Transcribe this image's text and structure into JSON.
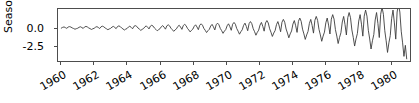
{
  "chart_data": {
    "type": "line",
    "title": "",
    "xlabel": "",
    "ylabel": "Seasonal",
    "xtick_labels": [
      "1960",
      "1962",
      "1964",
      "1966",
      "1968",
      "1970",
      "1972",
      "1974",
      "1976",
      "1978",
      "1980"
    ],
    "ytick_labels": [
      "0.0",
      "-2.5"
    ],
    "ytick_values": [
      0.0,
      -2.5
    ],
    "xlim": [
      1959.8,
      1981.2
    ],
    "ylim": [
      -4.6,
      2.6
    ],
    "grid": false,
    "legend": null,
    "line_color": "#3c3c3c",
    "series": [
      {
        "name": "Seasonal",
        "x": [
          1960.0,
          1960.083,
          1960.167,
          1960.25,
          1960.333,
          1960.417,
          1960.5,
          1960.583,
          1960.667,
          1960.75,
          1960.833,
          1960.917,
          1961.0,
          1961.083,
          1961.167,
          1961.25,
          1961.333,
          1961.417,
          1961.5,
          1961.583,
          1961.667,
          1961.75,
          1961.833,
          1961.917,
          1962.0,
          1962.083,
          1962.167,
          1962.25,
          1962.333,
          1962.417,
          1962.5,
          1962.583,
          1962.667,
          1962.75,
          1962.833,
          1962.917,
          1963.0,
          1963.083,
          1963.167,
          1963.25,
          1963.333,
          1963.417,
          1963.5,
          1963.583,
          1963.667,
          1963.75,
          1963.833,
          1963.917,
          1964.0,
          1964.083,
          1964.167,
          1964.25,
          1964.333,
          1964.417,
          1964.5,
          1964.583,
          1964.667,
          1964.75,
          1964.833,
          1964.917,
          1965.0,
          1965.083,
          1965.167,
          1965.25,
          1965.333,
          1965.417,
          1965.5,
          1965.583,
          1965.667,
          1965.75,
          1965.833,
          1965.917,
          1966.0,
          1966.083,
          1966.167,
          1966.25,
          1966.333,
          1966.417,
          1966.5,
          1966.583,
          1966.667,
          1966.75,
          1966.833,
          1966.917,
          1967.0,
          1967.083,
          1967.167,
          1967.25,
          1967.333,
          1967.417,
          1967.5,
          1967.583,
          1967.667,
          1967.75,
          1967.833,
          1967.917,
          1968.0,
          1968.083,
          1968.167,
          1968.25,
          1968.333,
          1968.417,
          1968.5,
          1968.583,
          1968.667,
          1968.75,
          1968.833,
          1968.917,
          1969.0,
          1969.083,
          1969.167,
          1969.25,
          1969.333,
          1969.417,
          1969.5,
          1969.583,
          1969.667,
          1969.75,
          1969.833,
          1969.917,
          1970.0,
          1970.083,
          1970.167,
          1970.25,
          1970.333,
          1970.417,
          1970.5,
          1970.583,
          1970.667,
          1970.75,
          1970.833,
          1970.917,
          1971.0,
          1971.083,
          1971.167,
          1971.25,
          1971.333,
          1971.417,
          1971.5,
          1971.583,
          1971.667,
          1971.75,
          1971.833,
          1971.917,
          1972.0,
          1972.083,
          1972.167,
          1972.25,
          1972.333,
          1972.417,
          1972.5,
          1972.583,
          1972.667,
          1972.75,
          1972.833,
          1972.917,
          1973.0,
          1973.083,
          1973.167,
          1973.25,
          1973.333,
          1973.417,
          1973.5,
          1973.583,
          1973.667,
          1973.75,
          1973.833,
          1973.917,
          1974.0,
          1974.083,
          1974.167,
          1974.25,
          1974.333,
          1974.417,
          1974.5,
          1974.583,
          1974.667,
          1974.75,
          1974.833,
          1974.917,
          1975.0,
          1975.083,
          1975.167,
          1975.25,
          1975.333,
          1975.417,
          1975.5,
          1975.583,
          1975.667,
          1975.75,
          1975.833,
          1975.917,
          1976.0,
          1976.083,
          1976.167,
          1976.25,
          1976.333,
          1976.417,
          1976.5,
          1976.583,
          1976.667,
          1976.75,
          1976.833,
          1976.917,
          1977.0,
          1977.083,
          1977.167,
          1977.25,
          1977.333,
          1977.417,
          1977.5,
          1977.583,
          1977.667,
          1977.75,
          1977.833,
          1977.917,
          1978.0,
          1978.083,
          1978.167,
          1978.25,
          1978.333,
          1978.417,
          1978.5,
          1978.583,
          1978.667,
          1978.75,
          1978.833,
          1978.917,
          1979.0,
          1979.083,
          1979.167,
          1979.25,
          1979.333,
          1979.417,
          1979.5,
          1979.583,
          1979.667,
          1979.75,
          1979.833,
          1979.917,
          1980.0,
          1980.083,
          1980.167,
          1980.25,
          1980.333,
          1980.417,
          1980.5,
          1980.583,
          1980.667,
          1980.75,
          1980.833,
          1980.917,
          1981.0
        ],
        "y": [
          -0.05,
          0.06,
          0.12,
          0.02,
          -0.08,
          0.1,
          0.16,
          0.1,
          -0.02,
          -0.1,
          -0.2,
          -0.12,
          -0.06,
          0.07,
          0.14,
          0.03,
          -0.09,
          0.12,
          0.19,
          0.12,
          -0.02,
          -0.12,
          -0.23,
          -0.14,
          -0.07,
          0.08,
          0.16,
          0.04,
          -0.1,
          0.14,
          0.22,
          0.14,
          -0.03,
          -0.14,
          -0.27,
          -0.16,
          -0.08,
          0.1,
          0.19,
          0.05,
          -0.12,
          0.17,
          0.26,
          0.17,
          -0.03,
          -0.16,
          -0.31,
          -0.19,
          -0.1,
          0.11,
          0.22,
          0.06,
          -0.14,
          0.2,
          0.3,
          0.2,
          -0.04,
          -0.19,
          -0.36,
          -0.22,
          -0.11,
          0.13,
          0.26,
          0.07,
          -0.16,
          0.23,
          0.35,
          0.23,
          -0.05,
          -0.22,
          -0.42,
          -0.26,
          -0.13,
          0.15,
          0.3,
          0.08,
          -0.19,
          0.27,
          0.41,
          0.27,
          -0.06,
          -0.26,
          -0.49,
          -0.3,
          -0.15,
          0.18,
          0.35,
          0.1,
          -0.22,
          0.31,
          0.47,
          0.31,
          -0.07,
          -0.3,
          -0.57,
          -0.35,
          -0.18,
          0.21,
          0.41,
          0.11,
          -0.26,
          0.36,
          0.55,
          0.36,
          -0.08,
          -0.35,
          -0.66,
          -0.4,
          -0.21,
          0.24,
          0.47,
          0.13,
          -0.3,
          0.42,
          0.64,
          0.42,
          -0.09,
          -0.4,
          -0.77,
          -0.47,
          -0.24,
          0.28,
          0.55,
          0.15,
          -0.35,
          0.49,
          0.74,
          0.49,
          -0.11,
          -0.47,
          -0.89,
          -0.54,
          -0.28,
          0.33,
          0.64,
          0.18,
          -0.41,
          0.57,
          0.86,
          0.57,
          -0.12,
          -0.54,
          -1.03,
          -0.63,
          -0.33,
          0.38,
          0.74,
          0.2,
          -0.47,
          0.66,
          1.0,
          0.66,
          -0.14,
          -0.63,
          -1.2,
          -0.73,
          -0.38,
          0.44,
          0.86,
          0.24,
          -0.55,
          0.77,
          1.16,
          0.77,
          -0.17,
          -0.73,
          -1.39,
          -0.85,
          -0.44,
          0.51,
          1.0,
          0.28,
          -0.64,
          0.89,
          1.35,
          0.89,
          -0.19,
          -0.85,
          -1.61,
          -0.99,
          -0.51,
          0.6,
          1.16,
          0.32,
          -0.74,
          1.03,
          1.57,
          1.03,
          -0.22,
          -0.99,
          -1.87,
          -1.15,
          -0.6,
          0.69,
          1.35,
          0.37,
          -0.86,
          1.2,
          1.82,
          1.2,
          -0.26,
          -1.15,
          -2.18,
          -1.33,
          -0.69,
          0.8,
          1.57,
          0.43,
          -1.0,
          1.39,
          2.11,
          1.39,
          -0.3,
          -1.33,
          -2.53,
          -1.55,
          -0.8,
          0.93,
          1.82,
          0.5,
          -1.16,
          1.61,
          2.45,
          1.61,
          -0.35,
          -1.55,
          -2.94,
          -1.8,
          -0.93,
          1.08,
          2.11,
          0.58,
          -1.35,
          1.87,
          2.85,
          1.87,
          -0.41,
          -1.8,
          -3.41,
          -2.09,
          -1.08,
          1.25,
          2.45,
          0.67,
          -1.57,
          2.18,
          3.3,
          2.18,
          -0.47,
          -2.09,
          -3.96,
          -2.43,
          -4.3
        ]
      }
    ]
  },
  "axes": {
    "ylabel_text": "Seasonal",
    "ytick_0": "0.0",
    "ytick_1": "-2.5",
    "xtick_0": "1960",
    "xtick_1": "1962",
    "xtick_2": "1964",
    "xtick_3": "1966",
    "xtick_4": "1968",
    "xtick_5": "1970",
    "xtick_6": "1972",
    "xtick_7": "1974",
    "xtick_8": "1976",
    "xtick_9": "1978",
    "xtick_10": "1980"
  }
}
